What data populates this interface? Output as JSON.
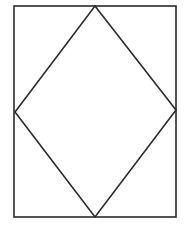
{
  "diagram": {
    "width": 184,
    "height": 230,
    "background": "#ffffff",
    "stroke_color": "#2a2a2a",
    "stroke_width": 1.6,
    "rectangle": {
      "x": 14,
      "y": 6,
      "width": 162,
      "height": 211
    },
    "rhombus": {
      "points": [
        [
          95,
          6
        ],
        [
          176,
          110
        ],
        [
          95,
          217
        ],
        [
          15,
          112
        ]
      ]
    }
  }
}
